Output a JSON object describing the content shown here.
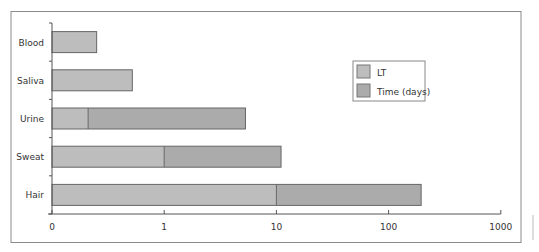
{
  "chart_data": {
    "type": "bar",
    "orientation": "horizontal",
    "stacked": true,
    "title": "",
    "xlabel": "",
    "ylabel": "",
    "x_scale": "log",
    "x_tick_labels": [
      "0",
      "1",
      "10",
      "100",
      "1000"
    ],
    "x_tick_values": [
      0.1,
      1,
      10,
      100,
      1000
    ],
    "xlim": [
      0.1,
      1000
    ],
    "categories": [
      "Blood",
      "Saliva",
      "Urine",
      "Sweat",
      "Hair"
    ],
    "series": [
      {
        "name": "LT",
        "color": "#bdbdbd",
        "values": [
          0.25,
          0.52,
          0.21,
          1.0,
          10
        ]
      },
      {
        "name": "Time (days)",
        "color": "#ababab",
        "values": [
          0.25,
          0.52,
          5.3,
          11,
          195
        ]
      }
    ],
    "legend": {
      "position": "inside-right",
      "entries": [
        "LT",
        "Time (days)"
      ]
    },
    "grid": false
  },
  "colors": {
    "frame": "#8a8a8a",
    "axis": "#555555",
    "bar_stroke": "#666666",
    "lt_fill": "#bdbdbd",
    "time_fill": "#ababab",
    "text": "#333333"
  }
}
